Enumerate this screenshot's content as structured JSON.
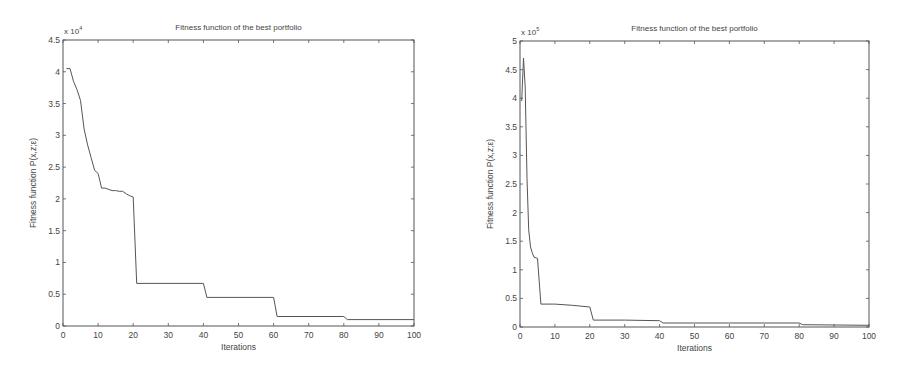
{
  "chart_data": [
    {
      "type": "line",
      "title": "Fitness function of the best portfolio",
      "xlabel": "Iterations",
      "ylabel": "Fitness function P(x,z;ε)",
      "y_multiplier": "x 10^4",
      "y_multiplier_base": "x 10",
      "y_multiplier_exp": "4",
      "xlim": [
        0,
        100
      ],
      "ylim": [
        0,
        4.5
      ],
      "xticks": [
        0,
        10,
        20,
        30,
        40,
        50,
        60,
        70,
        80,
        90,
        100
      ],
      "yticks": [
        0,
        0.5,
        1,
        1.5,
        2,
        2.5,
        3,
        3.5,
        4,
        4.5
      ],
      "ytick_labels": [
        "0",
        "0.5",
        "1",
        "1.5",
        "2",
        "2.5",
        "3",
        "3.5",
        "4",
        "4.5"
      ],
      "grid": false,
      "legend": null,
      "series": [
        {
          "name": "best fitness",
          "x": [
            1,
            2,
            3,
            4,
            5,
            6,
            7,
            8,
            9,
            10,
            11,
            12,
            13,
            14,
            15,
            16,
            17,
            18,
            19,
            20,
            21,
            40,
            41,
            60,
            61,
            80,
            81,
            100
          ],
          "y": [
            4.05,
            4.05,
            3.85,
            3.72,
            3.55,
            3.1,
            2.85,
            2.65,
            2.45,
            2.4,
            2.17,
            2.17,
            2.15,
            2.13,
            2.13,
            2.12,
            2.12,
            2.08,
            2.05,
            2.03,
            0.67,
            0.67,
            0.45,
            0.45,
            0.15,
            0.15,
            0.1,
            0.1
          ]
        }
      ]
    },
    {
      "type": "line",
      "title": "Fitness function of the best portfolio",
      "xlabel": "Iterations",
      "ylabel": "Fitness function P(x,z;ε)",
      "y_multiplier": "x 10^5",
      "y_multiplier_base": "x 10",
      "y_multiplier_exp": "5",
      "xlim": [
        0,
        100
      ],
      "ylim": [
        0,
        5
      ],
      "xticks": [
        0,
        10,
        20,
        30,
        40,
        50,
        60,
        70,
        80,
        90,
        100
      ],
      "yticks": [
        0,
        0.5,
        1,
        1.5,
        2,
        2.5,
        3,
        3.5,
        4,
        4.5,
        5
      ],
      "ytick_labels": [
        "0",
        "0.5",
        "1",
        "1.5",
        "2",
        "2.5",
        "3",
        "3.5",
        "4",
        "4.5",
        "5"
      ],
      "grid": false,
      "legend": null,
      "series": [
        {
          "name": "best fitness",
          "x": [
            0.5,
            1,
            1.5,
            2,
            2.5,
            3,
            3.5,
            4,
            5,
            6,
            10,
            15,
            20,
            21,
            30,
            40,
            41,
            60,
            80,
            81,
            100
          ],
          "y": [
            3.95,
            4.7,
            4.2,
            2.6,
            1.7,
            1.4,
            1.3,
            1.22,
            1.2,
            0.4,
            0.4,
            0.38,
            0.35,
            0.12,
            0.12,
            0.11,
            0.07,
            0.07,
            0.07,
            0.04,
            0.03
          ]
        }
      ]
    }
  ]
}
